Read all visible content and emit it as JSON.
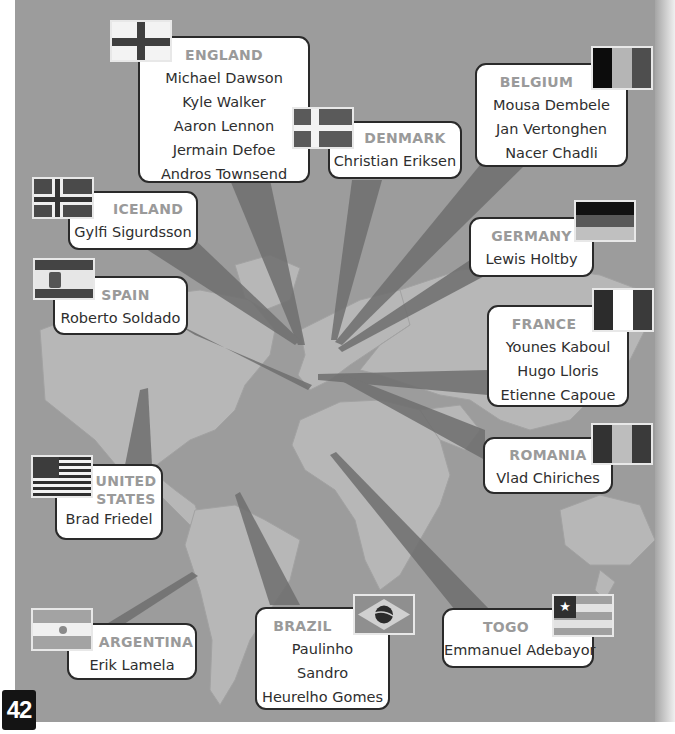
{
  "page": {
    "page_number": "42",
    "colors": {
      "panel_bg": "#9c9c9c",
      "land": "#b9b9b9",
      "ray": "#7c7c7c",
      "box_bg": "#ffffff",
      "box_border": "#2a2a2a",
      "country_label": "#9a9a9a",
      "player_text": "#2e2e2e"
    }
  },
  "countries": {
    "england": {
      "name": "ENGLAND",
      "flag_icon": "england-flag-icon",
      "players": [
        "Michael Dawson",
        "Kyle Walker",
        "Aaron Lennon",
        "Jermain Defoe",
        "Andros Townsend"
      ]
    },
    "denmark": {
      "name": "DENMARK",
      "flag_icon": "denmark-flag-icon",
      "players": [
        "Christian Eriksen"
      ]
    },
    "belgium": {
      "name": "BELGIUM",
      "flag_icon": "belgium-flag-icon",
      "players": [
        "Mousa Dembele",
        "Jan Vertonghen",
        "Nacer Chadli"
      ]
    },
    "iceland": {
      "name": "ICELAND",
      "flag_icon": "iceland-flag-icon",
      "players": [
        "Gylfi Sigurdsson"
      ]
    },
    "germany": {
      "name": "GERMANY",
      "flag_icon": "germany-flag-icon",
      "players": [
        "Lewis Holtby"
      ]
    },
    "spain": {
      "name": "SPAIN",
      "flag_icon": "spain-flag-icon",
      "players": [
        "Roberto Soldado"
      ]
    },
    "france": {
      "name": "FRANCE",
      "flag_icon": "france-flag-icon",
      "players": [
        "Younes Kaboul",
        "Hugo Lloris",
        "Etienne Capoue"
      ]
    },
    "romania": {
      "name": "ROMANIA",
      "flag_icon": "romania-flag-icon",
      "players": [
        "Vlad Chiriches"
      ]
    },
    "usa": {
      "name_line1": "UNITED",
      "name_line2": "STATES",
      "flag_icon": "usa-flag-icon",
      "players": [
        "Brad Friedel"
      ]
    },
    "argentina": {
      "name": "ARGENTINA",
      "flag_icon": "argentina-flag-icon",
      "players": [
        "Erik Lamela"
      ]
    },
    "brazil": {
      "name": "BRAZIL",
      "flag_icon": "brazil-flag-icon",
      "players": [
        "Paulinho",
        "Sandro",
        "Heurelho Gomes"
      ]
    },
    "togo": {
      "name": "TOGO",
      "flag_icon": "togo-flag-icon",
      "players": [
        "Emmanuel Adebayor"
      ]
    }
  }
}
